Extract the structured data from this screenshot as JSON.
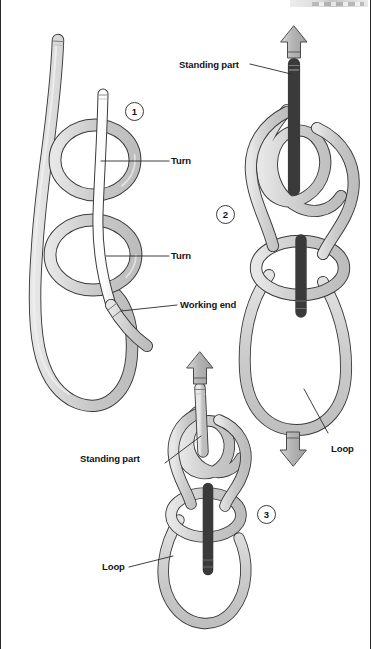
{
  "figure": {
    "kind": "knot-tying-instructional-diagram",
    "background_color": "#ffffff",
    "rope_fill": "#cccccc",
    "rope_highlight": "#eaeaea",
    "rope_outline": "#3a3a3a",
    "working_end_fill": "#fdfdfd",
    "arrow_fill": "#b7b7b7",
    "arrow_outline": "#4a4a4a",
    "label_color": "#141414"
  },
  "steps": [
    {
      "id": "step-1",
      "number": "1"
    },
    {
      "id": "step-2",
      "number": "2"
    },
    {
      "id": "step-3",
      "number": "3"
    }
  ],
  "labels": {
    "turn_upper": "Turn",
    "turn_lower": "Turn",
    "working_end": "Working end",
    "standing_part_step2": "Standing part",
    "standing_part_step3": "Standing part",
    "loop_step2": "Loop",
    "loop_step3": "Loop"
  },
  "arrows": [
    {
      "name": "pull-up-arrow-step2",
      "direction": "up"
    },
    {
      "name": "pull-down-arrow-step2",
      "direction": "down"
    },
    {
      "name": "pull-up-arrow-step3",
      "direction": "up"
    }
  ]
}
